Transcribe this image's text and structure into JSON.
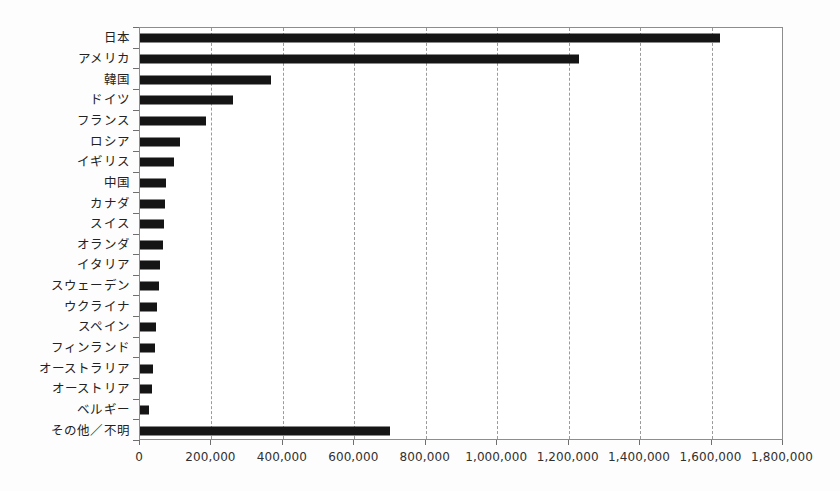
{
  "chart_data": {
    "type": "bar",
    "orientation": "horizontal",
    "title": "",
    "xlabel": "",
    "ylabel": "",
    "xlim": [
      0,
      1800000
    ],
    "xticks": [
      0,
      200000,
      400000,
      600000,
      800000,
      1000000,
      1200000,
      1400000,
      1600000,
      1800000
    ],
    "xtick_labels": [
      "0",
      "200,000",
      "400,000",
      "600,000",
      "800,000",
      "1,000,000",
      "1,200,000",
      "1,400,000",
      "1,600,000",
      "1,800,000"
    ],
    "grid": "vertical-dashed",
    "legend": "none",
    "bar_color": "#151515",
    "categories": [
      "日本",
      "アメリカ",
      "韓国",
      "ドイツ",
      "フランス",
      "ロシア",
      "イギリス",
      "中国",
      "カナダ",
      "スイス",
      "オランダ",
      "イタリア",
      "スウェーデン",
      "ウクライナ",
      "スペイン",
      "フィンランド",
      "オーストラリア",
      "オーストリア",
      "ベルギー",
      "その他／不明"
    ],
    "values": [
      1625000,
      1228000,
      368000,
      260000,
      185000,
      112000,
      96000,
      72000,
      70000,
      66000,
      64000,
      56000,
      54000,
      48000,
      46000,
      42000,
      36000,
      34000,
      26000,
      700000
    ]
  }
}
